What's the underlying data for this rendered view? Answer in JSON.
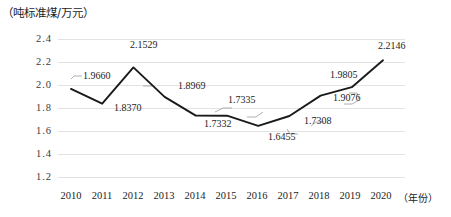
{
  "chart_data": {
    "type": "line",
    "title": "",
    "ylabel": "（吨标准煤/万元）",
    "xlabel": "（年份）",
    "categories": [
      "2010",
      "2011",
      "2012",
      "2013",
      "2014",
      "2015",
      "2016",
      "2017",
      "2018",
      "2019",
      "2020"
    ],
    "values": [
      1.966,
      1.837,
      2.1529,
      1.8969,
      1.7335,
      1.7332,
      1.6455,
      1.7308,
      1.9076,
      1.9805,
      2.2146
    ],
    "point_labels": [
      "1.9660",
      "1.8370",
      "2.1529",
      "1.8969",
      "1.7335",
      "1.7332",
      "1.6455",
      "1.7308",
      "1.9076",
      "1.9805",
      "2.2146"
    ],
    "ylim": [
      1.2,
      2.4
    ],
    "yticks": [
      "2.4",
      "2.2",
      "2.0",
      "1.8",
      "1.6",
      "1.4",
      "1.2"
    ],
    "grid": true,
    "legend": "none",
    "series_color": "#1a1a1a"
  }
}
